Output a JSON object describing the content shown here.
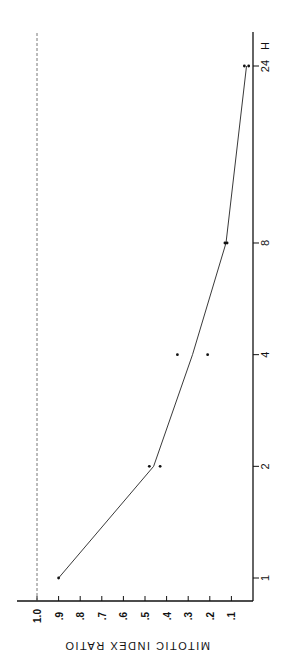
{
  "chart_data": {
    "type": "line",
    "title": "",
    "xlabel": "H",
    "ylabel": "MITOTIC INDEX RATIO",
    "x_scale": "log",
    "x_ticks": [
      "1",
      "2",
      "4",
      "8",
      "24"
    ],
    "x_unit_label": "H",
    "y_ticks": [
      "1.0",
      ".9",
      ".8",
      ".7",
      ".6",
      ".5",
      ".4",
      ".3",
      ".2",
      ".1"
    ],
    "ylim": [
      0,
      1.0
    ],
    "reference_line": {
      "y": 1.0,
      "style": "dashed"
    },
    "series": [
      {
        "name": "mean",
        "type": "line",
        "x": [
          1,
          2,
          4,
          8,
          24
        ],
        "values": [
          0.9,
          0.46,
          0.28,
          0.125,
          0.03
        ]
      },
      {
        "name": "observations",
        "type": "scatter",
        "points": [
          {
            "x": 1,
            "y": 0.9
          },
          {
            "x": 2,
            "y": 0.48
          },
          {
            "x": 2,
            "y": 0.43
          },
          {
            "x": 4,
            "y": 0.35
          },
          {
            "x": 4,
            "y": 0.21
          },
          {
            "x": 8,
            "y": 0.13
          },
          {
            "x": 8,
            "y": 0.12
          },
          {
            "x": 24,
            "y": 0.04
          },
          {
            "x": 24,
            "y": 0.02
          }
        ]
      }
    ],
    "orientation": "rotated 90deg counter-clockwise"
  }
}
